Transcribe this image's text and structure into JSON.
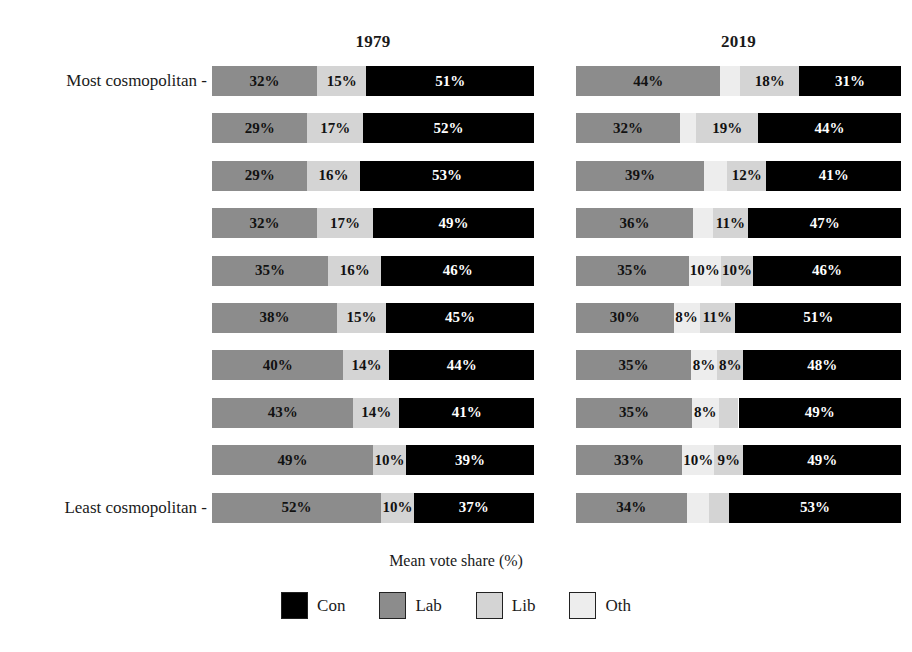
{
  "axis_title": "Mean vote share (%)",
  "y_axis": {
    "top_label": "Most cosmopolitan -",
    "bottom_label": "Least cosmopolitan -"
  },
  "legend": {
    "items": [
      {
        "label": "Con",
        "color": "#000000"
      },
      {
        "label": "Lab",
        "color": "#8c8c8c"
      },
      {
        "label": "Lib",
        "color": "#d4d4d4"
      },
      {
        "label": "Oth",
        "color": "#ededed"
      }
    ]
  },
  "panels": [
    {
      "id": "1979",
      "title": "1979"
    },
    {
      "id": "2019",
      "title": "2019"
    }
  ],
  "chart_data": {
    "type": "bar",
    "orientation": "horizontal",
    "stacked": true,
    "title": "",
    "xlabel": "Mean vote share (%)",
    "ylabel": "",
    "xlim": [
      0,
      100
    ],
    "grid": false,
    "legend_position": "bottom",
    "legend_entries": [
      "Con",
      "Lab",
      "Lib",
      "Oth"
    ],
    "colors": {
      "Con": "#000000",
      "Lab": "#8c8c8c",
      "Lib": "#d4d4d4",
      "Oth": "#ededed"
    },
    "facets": [
      "1979",
      "2019"
    ],
    "categories": [
      "Most cosmopolitan",
      "decile 2",
      "decile 3",
      "decile 4",
      "decile 5",
      "decile 6",
      "decile 7",
      "decile 8",
      "decile 9",
      "Least cosmopolitan"
    ],
    "panel_1979": [
      {
        "row": 1,
        "segments": [
          {
            "party": "Lab",
            "value": 32,
            "label": "32%"
          },
          {
            "party": "Lib",
            "value": 15,
            "label": "15%"
          },
          {
            "party": "Con",
            "value": 51,
            "label": "51%"
          }
        ]
      },
      {
        "row": 2,
        "segments": [
          {
            "party": "Lab",
            "value": 29,
            "label": "29%"
          },
          {
            "party": "Lib",
            "value": 17,
            "label": "17%"
          },
          {
            "party": "Con",
            "value": 52,
            "label": "52%"
          }
        ]
      },
      {
        "row": 3,
        "segments": [
          {
            "party": "Lab",
            "value": 29,
            "label": "29%"
          },
          {
            "party": "Lib",
            "value": 16,
            "label": "16%"
          },
          {
            "party": "Con",
            "value": 53,
            "label": "53%"
          }
        ]
      },
      {
        "row": 4,
        "segments": [
          {
            "party": "Lab",
            "value": 32,
            "label": "32%"
          },
          {
            "party": "Lib",
            "value": 17,
            "label": "17%"
          },
          {
            "party": "Con",
            "value": 49,
            "label": "49%"
          }
        ]
      },
      {
        "row": 5,
        "segments": [
          {
            "party": "Lab",
            "value": 35,
            "label": "35%"
          },
          {
            "party": "Lib",
            "value": 16,
            "label": "16%"
          },
          {
            "party": "Con",
            "value": 46,
            "label": "46%"
          }
        ]
      },
      {
        "row": 6,
        "segments": [
          {
            "party": "Lab",
            "value": 38,
            "label": "38%"
          },
          {
            "party": "Lib",
            "value": 15,
            "label": "15%"
          },
          {
            "party": "Con",
            "value": 45,
            "label": "45%"
          }
        ]
      },
      {
        "row": 7,
        "segments": [
          {
            "party": "Lab",
            "value": 40,
            "label": "40%"
          },
          {
            "party": "Lib",
            "value": 14,
            "label": "14%"
          },
          {
            "party": "Con",
            "value": 44,
            "label": "44%"
          }
        ]
      },
      {
        "row": 8,
        "segments": [
          {
            "party": "Lab",
            "value": 43,
            "label": "43%"
          },
          {
            "party": "Lib",
            "value": 14,
            "label": "14%"
          },
          {
            "party": "Con",
            "value": 41,
            "label": "41%"
          }
        ]
      },
      {
        "row": 9,
        "segments": [
          {
            "party": "Lab",
            "value": 49,
            "label": "49%"
          },
          {
            "party": "Lib",
            "value": 10,
            "label": "10%"
          },
          {
            "party": "Con",
            "value": 39,
            "label": "39%"
          }
        ]
      },
      {
        "row": 10,
        "segments": [
          {
            "party": "Lab",
            "value": 52,
            "label": "52%"
          },
          {
            "party": "Lib",
            "value": 10,
            "label": "10%"
          },
          {
            "party": "Con",
            "value": 37,
            "label": "37%"
          }
        ]
      }
    ],
    "panel_2019": [
      {
        "row": 1,
        "segments": [
          {
            "party": "Lab",
            "value": 44,
            "label": "44%"
          },
          {
            "party": "Oth",
            "value": 6,
            "label": ""
          },
          {
            "party": "Lib",
            "value": 18,
            "label": "18%"
          },
          {
            "party": "Con",
            "value": 31,
            "label": "31%"
          }
        ]
      },
      {
        "row": 2,
        "segments": [
          {
            "party": "Lab",
            "value": 32,
            "label": "32%"
          },
          {
            "party": "Oth",
            "value": 5,
            "label": ""
          },
          {
            "party": "Lib",
            "value": 19,
            "label": "19%"
          },
          {
            "party": "Con",
            "value": 44,
            "label": "44%"
          }
        ]
      },
      {
        "row": 3,
        "segments": [
          {
            "party": "Lab",
            "value": 39,
            "label": "39%"
          },
          {
            "party": "Oth",
            "value": 7,
            "label": ""
          },
          {
            "party": "Lib",
            "value": 12,
            "label": "12%"
          },
          {
            "party": "Con",
            "value": 41,
            "label": "41%"
          }
        ]
      },
      {
        "row": 4,
        "segments": [
          {
            "party": "Lab",
            "value": 36,
            "label": "36%"
          },
          {
            "party": "Oth",
            "value": 6,
            "label": ""
          },
          {
            "party": "Lib",
            "value": 11,
            "label": "11%"
          },
          {
            "party": "Con",
            "value": 47,
            "label": "47%"
          }
        ]
      },
      {
        "row": 5,
        "segments": [
          {
            "party": "Lab",
            "value": 35,
            "label": "35%"
          },
          {
            "party": "Oth",
            "value": 10,
            "label": "10%"
          },
          {
            "party": "Lib",
            "value": 10,
            "label": "10%"
          },
          {
            "party": "Con",
            "value": 46,
            "label": "46%"
          }
        ]
      },
      {
        "row": 6,
        "segments": [
          {
            "party": "Lab",
            "value": 30,
            "label": "30%"
          },
          {
            "party": "Oth",
            "value": 8,
            "label": "8%"
          },
          {
            "party": "Lib",
            "value": 11,
            "label": "11%"
          },
          {
            "party": "Con",
            "value": 51,
            "label": "51%"
          }
        ]
      },
      {
        "row": 7,
        "segments": [
          {
            "party": "Lab",
            "value": 35,
            "label": "35%"
          },
          {
            "party": "Oth",
            "value": 8,
            "label": "8%"
          },
          {
            "party": "Lib",
            "value": 8,
            "label": "8%"
          },
          {
            "party": "Con",
            "value": 48,
            "label": "48%"
          }
        ]
      },
      {
        "row": 8,
        "segments": [
          {
            "party": "Lab",
            "value": 35,
            "label": "35%"
          },
          {
            "party": "Oth",
            "value": 8,
            "label": "8%"
          },
          {
            "party": "Lib",
            "value": 6,
            "label": ""
          },
          {
            "party": "Con",
            "value": 49,
            "label": "49%"
          }
        ]
      },
      {
        "row": 9,
        "segments": [
          {
            "party": "Lab",
            "value": 33,
            "label": "33%"
          },
          {
            "party": "Oth",
            "value": 10,
            "label": "10%"
          },
          {
            "party": "Lib",
            "value": 9,
            "label": "9%"
          },
          {
            "party": "Con",
            "value": 49,
            "label": "49%"
          }
        ]
      },
      {
        "row": 10,
        "segments": [
          {
            "party": "Lab",
            "value": 34,
            "label": "34%"
          },
          {
            "party": "Oth",
            "value": 7,
            "label": ""
          },
          {
            "party": "Lib",
            "value": 6,
            "label": ""
          },
          {
            "party": "Con",
            "value": 53,
            "label": "53%"
          }
        ]
      }
    ]
  }
}
